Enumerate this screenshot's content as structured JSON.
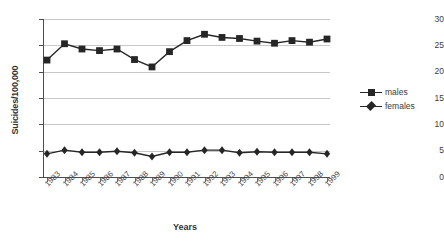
{
  "chart_data": {
    "type": "line",
    "title": "",
    "subtitle": "",
    "xlabel": "Years",
    "ylabel": "Suicides/100,000",
    "categories": [
      "1983",
      "1984",
      "1985",
      "1986",
      "1987",
      "1988",
      "1989",
      "1990",
      "1991",
      "1992",
      "1993",
      "1994",
      "1995",
      "1996",
      "1997",
      "1998",
      "1999"
    ],
    "series": [
      {
        "name": "males",
        "marker": "square",
        "color": "#262626",
        "values": [
          22.2,
          25.3,
          24.3,
          24.0,
          24.3,
          22.3,
          20.9,
          23.8,
          25.9,
          27.1,
          26.5,
          26.3,
          25.8,
          25.4,
          25.9,
          25.6,
          26.2
        ]
      },
      {
        "name": "females",
        "marker": "diamond",
        "color": "#262626",
        "values": [
          4.4,
          5.1,
          4.7,
          4.7,
          4.9,
          4.6,
          3.9,
          4.7,
          4.7,
          5.1,
          5.1,
          4.6,
          4.8,
          4.7,
          4.7,
          4.7,
          4.4
        ]
      }
    ],
    "ylim": [
      0,
      30
    ],
    "yticks": [
      0,
      5,
      10,
      15,
      20,
      25,
      30
    ],
    "ytick_labels": [
      "0",
      "5",
      "10",
      "15",
      "20",
      "25",
      "30"
    ],
    "grid": true,
    "grid_axis": "y",
    "legend_position": "right",
    "legend_entries": [
      "males",
      "females"
    ],
    "axis_color": "#4d4d4d",
    "grid_color": "#c8c8c8",
    "background": "#ffffff"
  }
}
